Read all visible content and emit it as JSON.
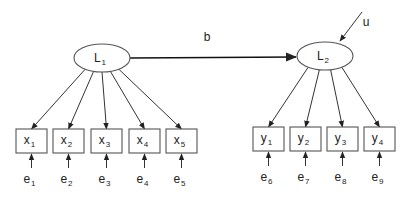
{
  "diagram": {
    "type": "structural-equation-model",
    "latent": [
      {
        "id": "L1",
        "label": "L",
        "sub": "1",
        "cx": 102,
        "cy": 58,
        "rx": 28,
        "ry": 14
      },
      {
        "id": "L2",
        "label": "L",
        "sub": "2",
        "cx": 325,
        "cy": 56,
        "rx": 28,
        "ry": 14
      }
    ],
    "path": {
      "from": "L1",
      "to": "L2",
      "label": "b",
      "label_x": 207,
      "label_y": 41
    },
    "disturbance": {
      "label": "u",
      "target": "L2",
      "label_x": 366,
      "label_y": 26
    },
    "indicators_x": [
      {
        "label": "x",
        "sub": "1",
        "error": "e",
        "error_sub": "1",
        "x": 16
      },
      {
        "label": "x",
        "sub": "2",
        "error": "e",
        "error_sub": "2",
        "x": 53
      },
      {
        "label": "x",
        "sub": "3",
        "error": "e",
        "error_sub": "3",
        "x": 91
      },
      {
        "label": "x",
        "sub": "4",
        "error": "e",
        "error_sub": "4",
        "x": 129
      },
      {
        "label": "x",
        "sub": "5",
        "error": "e",
        "error_sub": "5",
        "x": 166
      }
    ],
    "indicators_y": [
      {
        "label": "y",
        "sub": "1",
        "error": "e",
        "error_sub": "6",
        "x": 253
      },
      {
        "label": "y",
        "sub": "2",
        "error": "e",
        "error_sub": "7",
        "x": 290
      },
      {
        "label": "y",
        "sub": "3",
        "error": "e",
        "error_sub": "8",
        "x": 327
      },
      {
        "label": "y",
        "sub": "4",
        "error": "e",
        "error_sub": "9",
        "x": 364
      }
    ],
    "box": {
      "width": 31,
      "height": 24,
      "x_top": 129,
      "y_top": 127
    },
    "colors": {
      "stroke": "#555555",
      "text": "#222222",
      "background": "#ffffff"
    }
  }
}
